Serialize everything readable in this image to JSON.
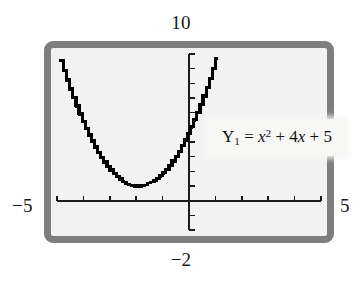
{
  "window_frame": {
    "border_color": "#7e7e7e",
    "screen_color": "#f2f2f2"
  },
  "labels": {
    "y_max": "10",
    "y_min": "−2",
    "x_min": "−5",
    "x_max": "5"
  },
  "equation_callout": {
    "name_prefix": "Y",
    "name_subscript": "1",
    "equals": "=",
    "term1_base": "x",
    "term1_exp": "2",
    "plus1": "+",
    "term2_coeff": "4",
    "term2_var": "x",
    "plus2": "+",
    "term3": "5",
    "full_text": "Y₁ = x² + 4x + 5"
  },
  "chart_data": {
    "type": "line",
    "title": "",
    "subtitle": "",
    "xlabel": "",
    "ylabel": "",
    "xlim": [
      -5,
      5
    ],
    "ylim": [
      -2,
      10
    ],
    "xtick_step": 1,
    "ytick_step": 1,
    "grid": false,
    "legend_position": "inside-right",
    "axis_color": "#1a1a1a",
    "curve_color": "#000000",
    "curve_style": "pixelated-stepped",
    "annotations": [
      {
        "text": "Y₁ = x² + 4x + 5",
        "x": 1.4,
        "y": 4.2
      }
    ],
    "series": [
      {
        "name": "Y₁ = x² + 4x + 5",
        "equation": "y = x^2 + 4x + 5",
        "vertex": [
          -2,
          1
        ],
        "x": [
          -4.9,
          -4.7,
          -4.5,
          -4.3,
          -4.1,
          -3.9,
          -3.7,
          -3.5,
          -3.3,
          -3.1,
          -2.9,
          -2.7,
          -2.5,
          -2.3,
          -2.1,
          -1.9,
          -1.7,
          -1.5,
          -1.3,
          -1.1,
          -0.9,
          -0.7,
          -0.5,
          -0.3,
          -0.1,
          0.1,
          0.3,
          0.5,
          0.7,
          0.9,
          1.1
        ],
        "values": [
          9.41,
          8.29,
          7.25,
          6.29,
          5.41,
          4.61,
          3.89,
          3.25,
          2.69,
          2.21,
          1.81,
          1.49,
          1.25,
          1.09,
          1.01,
          1.01,
          1.09,
          1.25,
          1.49,
          1.81,
          2.21,
          2.69,
          3.25,
          3.89,
          4.61,
          5.41,
          6.29,
          7.25,
          8.29,
          9.41,
          10.61
        ]
      }
    ]
  }
}
